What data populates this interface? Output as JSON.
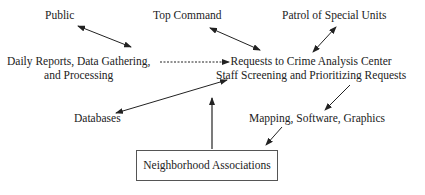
{
  "diagram": {
    "nodes": {
      "public": "Public",
      "top_command": "Top Command",
      "patrol": "Patrol of Special Units",
      "daily_line1": "Daily Reports, Data Gathering,",
      "daily_line2": "and Processing",
      "center_line1": "Requests to Crime Analysis Center",
      "center_line2": "Staff Screening and Prioritizing Requests",
      "databases": "Databases",
      "mapping": "Mapping, Software, Graphics",
      "neighborhood": "Neighborhood Associations"
    },
    "edges": [
      {
        "from": "public",
        "to": "daily",
        "type": "bidirectional"
      },
      {
        "from": "top_command",
        "to": "center",
        "type": "bidirectional"
      },
      {
        "from": "patrol",
        "to": "center",
        "type": "bidirectional"
      },
      {
        "from": "daily",
        "to": "center",
        "type": "dashed-directed"
      },
      {
        "from": "databases",
        "to": "center",
        "type": "bidirectional"
      },
      {
        "from": "neighborhood",
        "to": "center",
        "type": "directed"
      },
      {
        "from": "center",
        "to": "mapping",
        "type": "directed"
      },
      {
        "from": "mapping",
        "to": "neighborhood",
        "type": "directed"
      }
    ]
  }
}
